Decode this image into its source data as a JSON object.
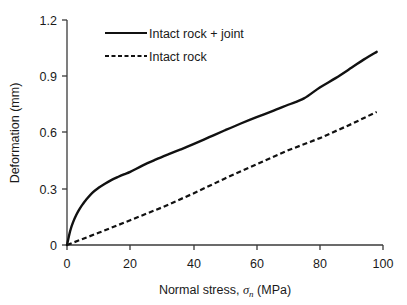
{
  "chart_data": {
    "type": "line",
    "title": "",
    "xlabel": "Normal stress, σn (MPa)",
    "xlabel_prefix": "Normal stress, ",
    "xlabel_symbol": "σ",
    "xlabel_subscript": "n",
    "xlabel_suffix": " (MPa)",
    "ylabel": "Deformation (mm)",
    "xlim": [
      0,
      100
    ],
    "ylim": [
      0,
      1.2
    ],
    "xticks": [
      0,
      20,
      40,
      60,
      80,
      100
    ],
    "xtick_labels": [
      "0",
      "20",
      "40",
      "60",
      "80",
      "100"
    ],
    "yticks": [
      0,
      0.3,
      0.6,
      0.9,
      1.2
    ],
    "ytick_labels": [
      "0",
      "0.3",
      "0.6",
      "0.9",
      "1.2"
    ],
    "grid": false,
    "legend_position": "upper-left-inside",
    "series": [
      {
        "name": "Intact rock + joint",
        "style": "solid",
        "color": "#111111",
        "x": [
          0,
          1,
          2,
          3,
          4,
          5,
          6,
          8,
          10,
          12,
          14,
          16,
          18,
          20,
          24,
          28,
          32,
          36,
          40,
          45,
          50,
          55,
          60,
          65,
          70,
          75,
          80,
          85,
          90,
          94,
          98
        ],
        "y": [
          0,
          0.075,
          0.125,
          0.163,
          0.193,
          0.218,
          0.24,
          0.278,
          0.305,
          0.327,
          0.346,
          0.362,
          0.377,
          0.39,
          0.425,
          0.455,
          0.483,
          0.51,
          0.538,
          0.575,
          0.612,
          0.648,
          0.682,
          0.714,
          0.748,
          0.782,
          0.84,
          0.89,
          0.945,
          0.99,
          1.03
        ]
      },
      {
        "name": "Intact rock",
        "style": "dashed",
        "color": "#111111",
        "x": [
          0,
          10,
          20,
          30,
          40,
          50,
          60,
          70,
          80,
          90,
          98
        ],
        "y": [
          0,
          0.065,
          0.132,
          0.2,
          0.275,
          0.355,
          0.43,
          0.505,
          0.57,
          0.645,
          0.71
        ]
      }
    ]
  },
  "legend": {
    "entries": [
      {
        "label": "Intact rock + joint",
        "style": "solid"
      },
      {
        "label": "Intact rock",
        "style": "dashed"
      }
    ]
  },
  "colors": {
    "axis": "#3a3a3a",
    "series": "#111111",
    "background": "#ffffff",
    "text": "#1a1a1a"
  }
}
